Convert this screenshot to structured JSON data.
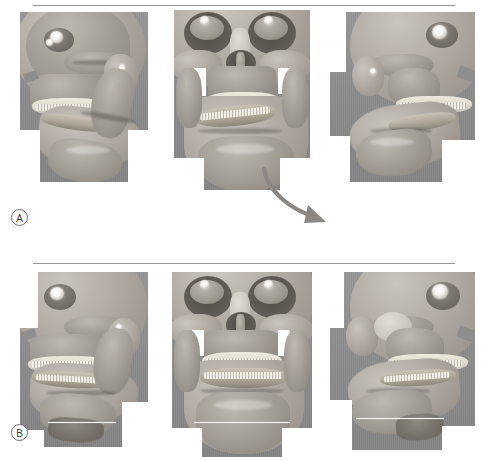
{
  "figure": {
    "panels": [
      {
        "id": "A",
        "label": "A",
        "views": [
          {
            "id": "left-lateral",
            "name": "left-lateral-view"
          },
          {
            "id": "frontal",
            "name": "frontal-view"
          },
          {
            "id": "right-lateral",
            "name": "right-lateral-view"
          }
        ],
        "annotations": [
          {
            "type": "arrow",
            "name": "mandibular-deviation-arrow",
            "color": "#8a8785"
          }
        ]
      },
      {
        "id": "B",
        "label": "B",
        "views": [
          {
            "id": "left-lateral",
            "name": "left-lateral-view"
          },
          {
            "id": "frontal",
            "name": "frontal-view"
          },
          {
            "id": "right-lateral",
            "name": "right-lateral-view"
          }
        ],
        "annotations": [
          {
            "type": "reference-line",
            "name": "chin-reference-line",
            "color": "#f4f4f2"
          },
          {
            "type": "reference-line",
            "name": "chin-reference-line",
            "color": "#f4f4f2"
          },
          {
            "type": "reference-line",
            "name": "chin-reference-line",
            "color": "#f4f4f2"
          }
        ]
      }
    ],
    "rules": [
      {
        "name": "top-rule",
        "color": "#9a9a9a"
      },
      {
        "name": "middle-rule",
        "color": "#9a9a9a"
      }
    ],
    "colors": {
      "background": "#ffffff",
      "render_background": "#8e8e8e",
      "bone": "#aaa49c",
      "metal": "#ffffff",
      "rule": "#9a9a9a",
      "annotation": "#8a8785",
      "reference_line": "#f4f4f2"
    }
  }
}
